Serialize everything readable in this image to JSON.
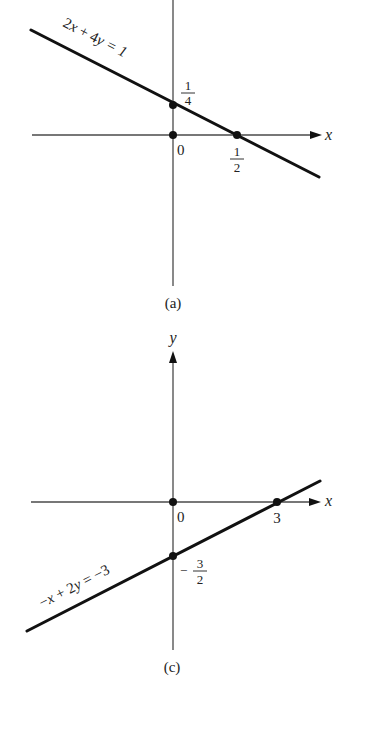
{
  "figure": {
    "panels": [
      {
        "id": "a",
        "caption": "(a)",
        "equation": "2x + 4y = 1",
        "equation_parts": {
          "a": "2",
          "var1": "x",
          "op": " + ",
          "b": "4",
          "var2": "y",
          "rhs": " = 1"
        },
        "x_axis_label": "x",
        "y_axis_label": "",
        "origin_label": "0",
        "y_intercept": {
          "numerator": "1",
          "denominator": "4",
          "sign": ""
        },
        "x_intercept": {
          "numerator": "1",
          "denominator": "2",
          "sign": ""
        }
      },
      {
        "id": "c",
        "caption": "(c)",
        "equation": "−x + 2y = −3",
        "equation_parts": {
          "a": "−",
          "var1": "x",
          "op": " + ",
          "b": "2",
          "var2": "y",
          "rhs": " = −3"
        },
        "x_axis_label": "x",
        "y_axis_label": "y",
        "origin_label": "0",
        "y_intercept": {
          "numerator": "3",
          "denominator": "2",
          "sign": "−"
        },
        "x_intercept": {
          "value": "3"
        }
      }
    ]
  },
  "colors": {
    "line": "#111111",
    "axis": "#4a4a4a",
    "background": "#ffffff"
  }
}
